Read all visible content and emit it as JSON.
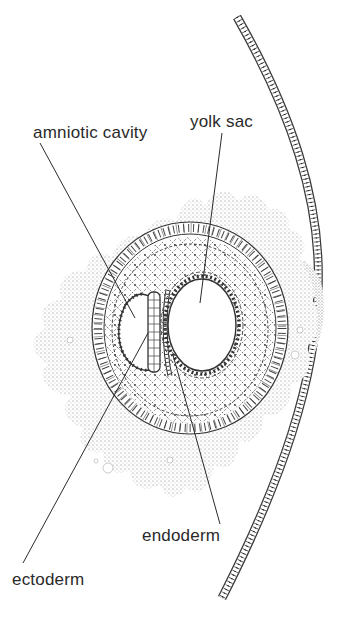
{
  "diagram": {
    "type": "anatomical-illustration",
    "colors": {
      "ink": "#2a2a2a",
      "stipple": "#8a8a8a",
      "background": "#ffffff"
    },
    "labels": [
      {
        "id": "amniotic-cavity",
        "text": "amniotic cavity",
        "x": 33,
        "y": 124,
        "pointer": {
          "from": [
            40,
            143
          ],
          "to": [
            135,
            318
          ]
        }
      },
      {
        "id": "yolk-sac",
        "text": "yolk sac",
        "x": 190,
        "y": 113,
        "pointer": {
          "from": [
            222,
            133
          ],
          "to": [
            200,
            303
          ]
        }
      },
      {
        "id": "endoderm",
        "text": "endoderm",
        "x": 142,
        "y": 527,
        "pointer": {
          "from": [
            220,
            524
          ],
          "to": [
            173,
            355
          ]
        }
      },
      {
        "id": "ectoderm",
        "text": "ectoderm",
        "x": 12,
        "y": 571,
        "pointer": {
          "from": [
            23,
            563
          ],
          "to": [
            148,
            333
          ]
        }
      }
    ]
  }
}
